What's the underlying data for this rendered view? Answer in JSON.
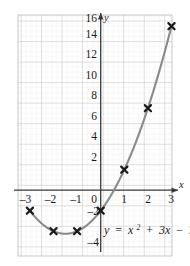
{
  "chart_data": {
    "type": "line",
    "title": "",
    "subtitle": "",
    "equation_text": "y = x² + 3x − 2",
    "equation_parts": {
      "lhs": "y",
      "equals": "=",
      "var1": "x",
      "exponent": "2",
      "plus": "+",
      "term2": "3x",
      "minus": "−",
      "constant": "2"
    },
    "xlabel": "x",
    "ylabel": "y",
    "xlim": [
      -3.4,
      3.4
    ],
    "ylim": [
      -5,
      17
    ],
    "x_ticks": [
      -3,
      -2,
      -1,
      0,
      1,
      2,
      3
    ],
    "x_tick_labels": [
      "–3",
      "–2",
      "–1",
      "0",
      "1",
      "2",
      "3"
    ],
    "y_ticks": [
      -4,
      -2,
      2,
      4,
      6,
      8,
      10,
      12,
      14,
      16
    ],
    "y_tick_labels": [
      "–4",
      "–2",
      "2",
      "4",
      "6",
      "8",
      "10",
      "12",
      "14",
      "16"
    ],
    "grid": true,
    "grid_major_step_x": 1,
    "grid_major_step_y": 2,
    "grid_minor_divisions": 4,
    "legend": "none",
    "series": [
      {
        "name": "y = x² + 3x − 2",
        "marker": "x-cross",
        "x": [
          -3,
          -2,
          -1,
          0,
          1,
          2,
          3
        ],
        "values": [
          -2,
          -4,
          -4,
          -2,
          2,
          8,
          16
        ]
      }
    ],
    "curve_color": "#8a8a8a",
    "marker_color": "#1a1a1a",
    "axis_color": "#3a3a3a",
    "grid_major_color": "#b9b9b9",
    "grid_minor_color": "#dcdcdc",
    "background_color": "#ffffff"
  },
  "figure": {
    "axis_x_name": "x",
    "axis_y_name": "y"
  }
}
